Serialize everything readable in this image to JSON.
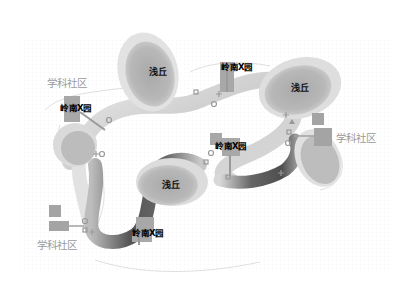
{
  "diagram": {
    "type": "landscape-path-diagram",
    "colors": {
      "background": "#ffffff",
      "path_light": "#e4e4e4",
      "path_dark": "#5a5a5a",
      "hill_fill": "#b5b5b5",
      "hill_halo": "#dcdcdc",
      "square_fill": "#a8a8a8",
      "community_text": "#9a9a9a",
      "label_text": "#000000"
    },
    "hills": [
      {
        "id": "hill-1",
        "label": "浅丘"
      },
      {
        "id": "hill-2",
        "label": "浅丘"
      },
      {
        "id": "hill-3",
        "label": "浅丘"
      }
    ],
    "gardens": [
      {
        "id": "garden-1",
        "label": "岭南X园"
      },
      {
        "id": "garden-2",
        "label": "岭南X园"
      },
      {
        "id": "garden-3",
        "label": "岭南X园"
      },
      {
        "id": "garden-4",
        "label": "岭南X园"
      }
    ],
    "communities": [
      {
        "id": "community-1",
        "label": "学科社区"
      },
      {
        "id": "community-2",
        "label": "学科社区"
      },
      {
        "id": "community-3",
        "label": "学科社区"
      }
    ],
    "markers": {
      "circle": "circle-marker",
      "square": "square-marker",
      "plus": "plus-marker",
      "triangle": "triangle-marker"
    }
  }
}
